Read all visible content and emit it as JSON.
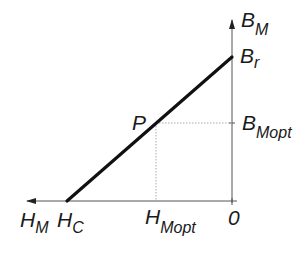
{
  "diagram": {
    "type": "demagnetization-line",
    "axes": {
      "vertical": {
        "label": "B",
        "subscript": "M"
      },
      "horizontal": {
        "label": "H",
        "subscript": "M"
      }
    },
    "points": {
      "remanence": {
        "label": "B",
        "subscript": "r"
      },
      "coercivity": {
        "label": "H",
        "subscript": "C"
      },
      "operating": {
        "label": "P"
      },
      "b_opt": {
        "label": "B",
        "subscript": "Mopt"
      },
      "h_opt": {
        "label": "H",
        "subscript": "Mopt"
      },
      "origin": {
        "label": "0"
      }
    },
    "colors": {
      "line": "#111111",
      "axis": "#555555",
      "guide": "#aaaaaa"
    }
  }
}
